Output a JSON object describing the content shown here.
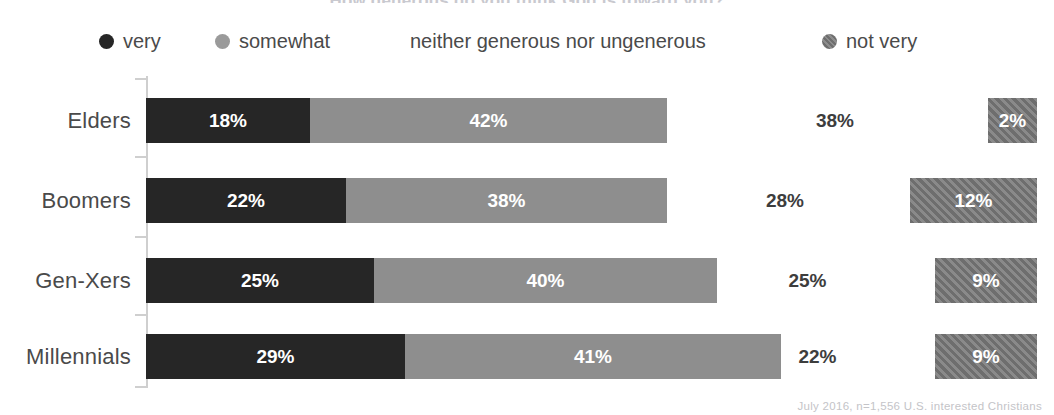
{
  "title": "How generous do you think God is toward you?",
  "legend": {
    "items": [
      {
        "label": "very",
        "marker": "dot-dark",
        "color": "#262626"
      },
      {
        "label": "somewhat",
        "marker": "dot-gray",
        "color": "#8e8e8e"
      },
      {
        "label": "neither generous nor ungenerous",
        "marker": "none",
        "color": "#ffffff"
      },
      {
        "label": "not very",
        "marker": "dot-hatch-gray",
        "color": "#7b7b7b"
      }
    ]
  },
  "footnote": "July 2016, n=1,556 U.S. interested Christians",
  "chart_data": {
    "type": "bar",
    "orientation": "horizontal",
    "stacked": true,
    "title": "How generous do you think God is toward you?",
    "xlabel": "",
    "ylabel": "",
    "categories": [
      "Elders",
      "Boomers",
      "Gen-Xers",
      "Millennials"
    ],
    "series": [
      {
        "name": "very",
        "color": "#262626",
        "values": [
          18,
          22,
          25,
          29
        ]
      },
      {
        "name": "somewhat",
        "color": "#8e8e8e",
        "values": [
          42,
          38,
          40,
          41
        ]
      },
      {
        "name": "neither generous nor ungenerous",
        "color": "#ffffff",
        "values": [
          38,
          28,
          25,
          22
        ]
      },
      {
        "name": "not very",
        "color": "#7b7b7b",
        "values": [
          2,
          12,
          9,
          9
        ]
      }
    ],
    "value_labels": {
      "Elders": {
        "very": "18%",
        "somewhat": "42%",
        "neither": "38%",
        "not_very": "2%"
      },
      "Boomers": {
        "very": "22%",
        "somewhat": "38%",
        "neither": "28%",
        "not_very": "12%"
      },
      "Gen-Xers": {
        "very": "25%",
        "somewhat": "40%",
        "neither": "25%",
        "not_very": "9%"
      },
      "Millennials": {
        "very": "29%",
        "somewhat": "41%",
        "neither": "22%",
        "not_very": "9%"
      }
    },
    "xlim": [
      0,
      100
    ],
    "grid": false,
    "legend_position": "top"
  },
  "rows": [
    {
      "category": "Elders",
      "very": {
        "label": "18%",
        "left": 146,
        "width": 164
      },
      "somewhat": {
        "label": "42%",
        "left": 310,
        "width": 357
      },
      "neither": {
        "label": "38%",
        "left": 690,
        "width": 290
      },
      "notvery": {
        "label": "2%",
        "left": 988,
        "width": 49
      }
    },
    {
      "category": "Boomers",
      "very": {
        "label": "22%",
        "left": 146,
        "width": 200
      },
      "somewhat": {
        "label": "38%",
        "left": 346,
        "width": 321
      },
      "neither": {
        "label": "28%",
        "left": 660,
        "width": 250
      },
      "notvery": {
        "label": "12%",
        "left": 910,
        "width": 127
      }
    },
    {
      "category": "Gen-Xers",
      "very": {
        "label": "25%",
        "left": 146,
        "width": 228
      },
      "somewhat": {
        "label": "40%",
        "left": 374,
        "width": 343
      },
      "neither": {
        "label": "25%",
        "left": 680,
        "width": 255
      },
      "notvery": {
        "label": "9%",
        "left": 935,
        "width": 102
      }
    },
    {
      "category": "Millennials",
      "very": {
        "label": "29%",
        "left": 146,
        "width": 259
      },
      "somewhat": {
        "label": "41%",
        "left": 405,
        "width": 376
      },
      "neither": {
        "label": "22%",
        "left": 700,
        "width": 235
      },
      "notvery": {
        "label": "9%",
        "left": 935,
        "width": 102
      }
    }
  ]
}
